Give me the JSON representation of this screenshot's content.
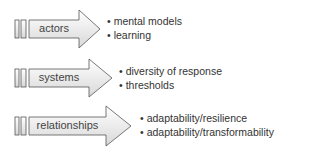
{
  "rows": [
    {
      "label": "actors",
      "bullets": [
        "mental models",
        "learning"
      ]
    },
    {
      "label": "systems",
      "bullets": [
        "diversity of response",
        "thresholds"
      ]
    },
    {
      "label": "relationships",
      "bullets": [
        "adaptability/resilience",
        "adaptability/transformability"
      ]
    }
  ],
  "colors": {
    "stroke": "#555555",
    "fill_top": "#ffffff",
    "fill_bottom": "#dcdcdc"
  }
}
